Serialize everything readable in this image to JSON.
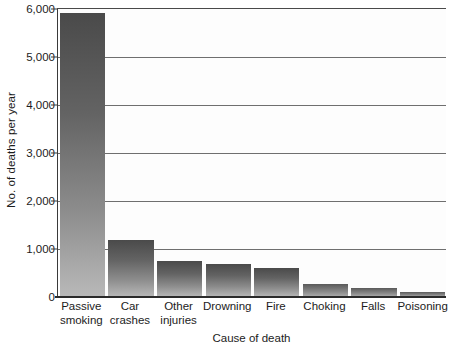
{
  "chart_data": {
    "type": "bar",
    "title": "",
    "xlabel": "Cause of death",
    "ylabel": "No. of deaths per year",
    "categories": [
      "Passive smoking",
      "Car crashes",
      "Other injuries",
      "Drowning",
      "Fire",
      "Choking",
      "Falls",
      "Poisoning"
    ],
    "values": [
      5920,
      1180,
      750,
      680,
      600,
      280,
      180,
      100
    ],
    "ylim": [
      0,
      6000
    ],
    "yticks": [
      0,
      1000,
      2000,
      3000,
      4000,
      5000,
      6000
    ],
    "ytick_labels": [
      "0",
      "1,000",
      "2,000",
      "3,000",
      "4,000",
      "5,000",
      "6,000"
    ],
    "grid": true,
    "grid_axis": "y",
    "legend": "none",
    "bar_color": "#6b6b6b",
    "background_color": "#ffffff",
    "axis_color": "#2b2b2b",
    "gridline_color": "#6f6f6f"
  },
  "axes": {
    "y_title": "No. of deaths per year",
    "x_title": "Cause of death"
  },
  "x_labels": [
    {
      "line1": "Passive",
      "line2": "smoking"
    },
    {
      "line1": "Car",
      "line2": "crashes"
    },
    {
      "line1": "Other",
      "line2": "injuries"
    },
    {
      "line1": "Drowning",
      "line2": ""
    },
    {
      "line1": "Fire",
      "line2": ""
    },
    {
      "line1": "Choking",
      "line2": ""
    },
    {
      "line1": "Falls",
      "line2": ""
    },
    {
      "line1": "Poisoning",
      "line2": ""
    }
  ]
}
